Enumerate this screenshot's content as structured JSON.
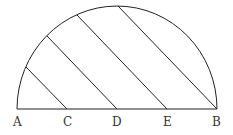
{
  "diagram": {
    "type": "semicircle-with-parallel-chords",
    "points": [
      {
        "label": "A",
        "x": 17,
        "y": 109
      },
      {
        "label": "C",
        "x": 67,
        "y": 109
      },
      {
        "label": "D",
        "x": 117,
        "y": 109
      },
      {
        "label": "E",
        "x": 167,
        "y": 109
      },
      {
        "label": "B",
        "x": 217,
        "y": 109
      }
    ],
    "chords": [
      {
        "from": "C",
        "to_arc": [
          26,
          67
        ]
      },
      {
        "from": "D",
        "to_arc": [
          47,
          36
        ]
      },
      {
        "from": "E",
        "to_arc": [
          77,
          15
        ]
      },
      {
        "from": "B",
        "to_arc": [
          118,
          6
        ]
      }
    ],
    "stroke_color": "#222222"
  },
  "labels": {
    "A": "A",
    "C": "C",
    "D": "D",
    "E": "E",
    "B": "B"
  }
}
